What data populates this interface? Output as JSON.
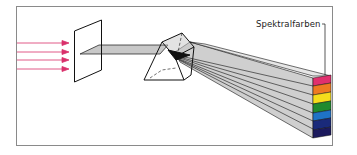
{
  "diagram": {
    "title": "",
    "labels": {
      "spectrum": "Spektralfarben"
    },
    "colors": {
      "frame": "#8a8a8a",
      "incoming_light": "#d9306b",
      "beam_fill": "#c8c8c8",
      "outline": "#111111"
    },
    "spectrum_bands": [
      {
        "name": "red-pink",
        "color": "#e0306e"
      },
      {
        "name": "orange",
        "color": "#ee7a22"
      },
      {
        "name": "yellow",
        "color": "#f5dd1c"
      },
      {
        "name": "green",
        "color": "#1f8a2e"
      },
      {
        "name": "blue",
        "color": "#1f73c6"
      },
      {
        "name": "indigo",
        "color": "#1a2a7a"
      },
      {
        "name": "violet",
        "color": "#1c1a5e"
      }
    ]
  }
}
